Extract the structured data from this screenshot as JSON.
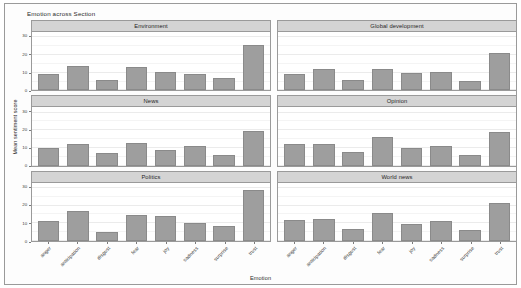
{
  "chart_data": {
    "type": "bar",
    "title": "Emotion across Section",
    "xlabel": "Emotion",
    "ylabel": "Mean sentiment score",
    "categories": [
      "anger",
      "anticipation",
      "disgust",
      "fear",
      "joy",
      "sadness",
      "surprise",
      "trust"
    ],
    "ylim": [
      0,
      33
    ],
    "yticks": [
      0,
      10,
      20,
      30
    ],
    "grid": true,
    "legend": "none",
    "facet_layout": {
      "rows": 3,
      "cols": 2,
      "facet_variable": "Section"
    },
    "bar_color": "#9e9e9e",
    "strip_color": "#d4d4d4",
    "panels": [
      {
        "label": "Environment",
        "values": [
          9.5,
          14.0,
          6.0,
          13.0,
          10.5,
          9.5,
          7.0,
          25.5
        ]
      },
      {
        "label": "Global development",
        "values": [
          9.0,
          12.0,
          6.0,
          12.0,
          10.0,
          10.5,
          5.5,
          21.0
        ]
      },
      {
        "label": "News",
        "values": [
          10.0,
          12.5,
          7.0,
          13.0,
          9.0,
          11.0,
          6.0,
          19.5
        ]
      },
      {
        "label": "Opinion",
        "values": [
          12.5,
          12.0,
          7.5,
          16.0,
          10.0,
          11.0,
          6.0,
          19.0
        ]
      },
      {
        "label": "Politics",
        "values": [
          11.5,
          17.0,
          5.0,
          14.5,
          14.0,
          10.0,
          8.5,
          29.0
        ]
      },
      {
        "label": "World news",
        "values": [
          12.0,
          12.5,
          7.0,
          16.0,
          9.5,
          11.5,
          6.0,
          21.5
        ]
      }
    ]
  }
}
